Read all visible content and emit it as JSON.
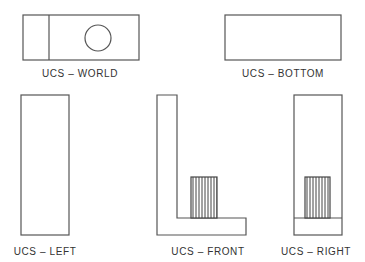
{
  "diagram": {
    "type": "orthographic-views",
    "colors": {
      "line": "#555555",
      "text": "#333333",
      "background": "#ffffff",
      "hatch": "#444444"
    },
    "views": [
      {
        "id": "world",
        "label": "UCS  –  WORLD"
      },
      {
        "id": "bottom",
        "label": "UCS  –  BOTTOM"
      },
      {
        "id": "left",
        "label": "UCS  –  LEFT"
      },
      {
        "id": "front",
        "label": "UCS  –  FRONT"
      },
      {
        "id": "right",
        "label": "UCS  –  RIGHT"
      }
    ]
  }
}
